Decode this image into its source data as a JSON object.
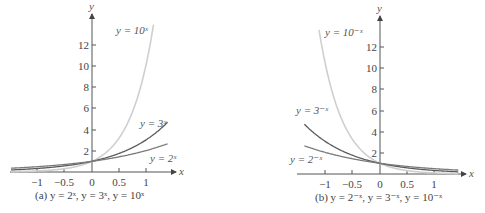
{
  "chart_data": [
    {
      "type": "line",
      "title": "(a) y = 2^x, y = 3^x, y = 10^x",
      "caption": "(a) y = 2ˣ, y = 3ˣ, y = 10ˣ",
      "xlabel": "x",
      "ylabel": "y",
      "xlim": [
        -1.5,
        1.5
      ],
      "ylim": [
        0,
        14
      ],
      "x_ticks": [
        "-1",
        "-0.5",
        "0",
        "0.5",
        "1"
      ],
      "y_ticks": [
        "2",
        "4",
        "6",
        "8",
        "10",
        "12"
      ],
      "grid": false,
      "series": [
        {
          "name": "y = 2ˣ",
          "color": "#7a7a7a",
          "base": 2,
          "sign": 1
        },
        {
          "name": "y = 3ˣ",
          "color": "#5a5a5a",
          "base": 3,
          "sign": 1
        },
        {
          "name": "y = 10ˣ",
          "color": "#cfcfcf",
          "base": 10,
          "sign": 1
        }
      ]
    },
    {
      "type": "line",
      "title": "(b) y = 2^-x, y = 3^-x, y = 10^-x",
      "caption": "(b) y = 2⁻ˣ, y = 3⁻ˣ, y = 10⁻ˣ",
      "xlabel": "x",
      "ylabel": "y",
      "xlim": [
        -1.5,
        1.5
      ],
      "ylim": [
        0,
        14
      ],
      "x_ticks": [
        "-1",
        "-0.5",
        "0",
        "0.5",
        "1"
      ],
      "y_ticks": [
        "2",
        "4",
        "6",
        "8",
        "10",
        "12"
      ],
      "grid": false,
      "series": [
        {
          "name": "y = 2⁻ˣ",
          "color": "#7a7a7a",
          "base": 2,
          "sign": -1
        },
        {
          "name": "y = 3⁻ˣ",
          "color": "#5a5a5a",
          "base": 3,
          "sign": -1
        },
        {
          "name": "y = 10⁻ˣ",
          "color": "#cfcfcf",
          "base": 10,
          "sign": -1
        }
      ]
    }
  ],
  "labels": {
    "a": {
      "y10": "y = 10ˣ",
      "y3": "y = 3ˣ",
      "y2": "y = 2ˣ",
      "caption": "(a) y = 2ˣ, y = 3ˣ, y = 10ˣ"
    },
    "b": {
      "y10": "y = 10⁻ˣ",
      "y3": "y = 3⁻ˣ",
      "y2": "y = 2⁻ˣ",
      "caption": "(b) y = 2⁻ˣ, y = 3⁻ˣ, y = 10⁻ˣ"
    },
    "axis_x": "x",
    "axis_y": "y",
    "xticks": [
      "−1",
      "−0.5",
      "0",
      "0.5",
      "1"
    ],
    "yticks": [
      "2",
      "4",
      "6",
      "8",
      "10",
      "12"
    ]
  }
}
